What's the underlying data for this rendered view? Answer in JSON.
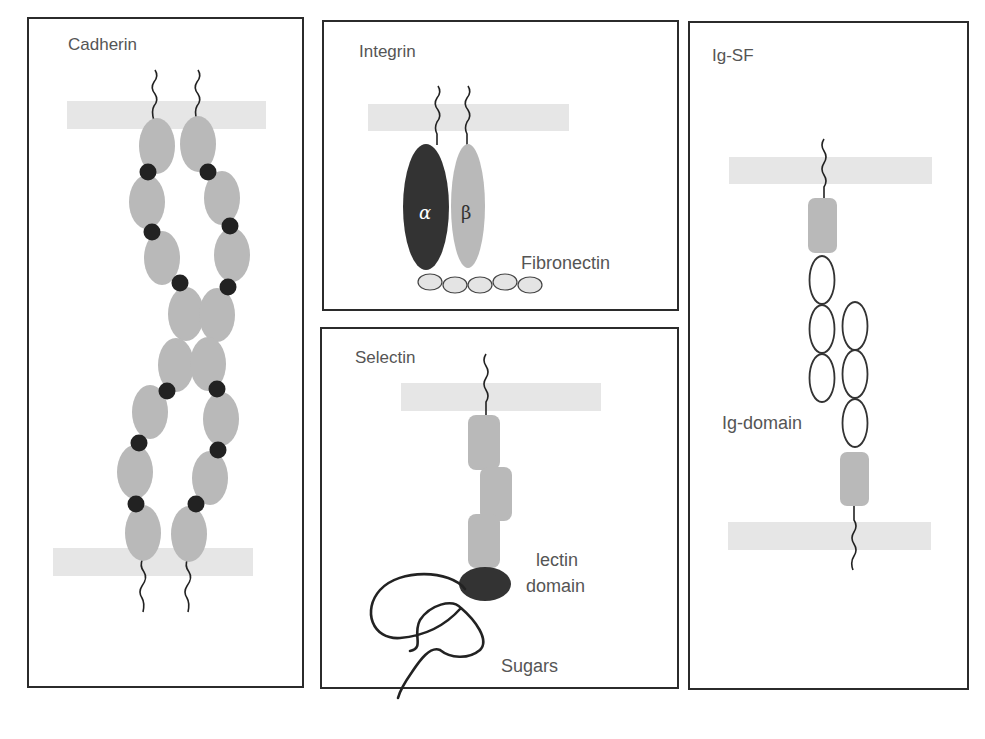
{
  "figure": {
    "colors": {
      "border": "#2b2b2b",
      "membrane": "#e6e6e6",
      "domain_gray": "#b9b9b9",
      "domain_dark": "#333333",
      "calcium_dot": "#222222",
      "fibronectin": "#e4e4e4",
      "text": "#555555"
    },
    "panels": [
      {
        "id": "cadherin",
        "title": "Cadherin"
      },
      {
        "id": "integrin",
        "title": "Integrin",
        "labels": {
          "alpha": "α",
          "beta": "β",
          "ligand": "Fibronectin"
        }
      },
      {
        "id": "selectin",
        "title": "Selectin",
        "labels": {
          "lectin_line1": "lectin",
          "lectin_line2": "domain",
          "sugars": "Sugars"
        }
      },
      {
        "id": "igsf",
        "title": "Ig-SF",
        "labels": {
          "domain": "Ig-domain"
        }
      }
    ]
  }
}
